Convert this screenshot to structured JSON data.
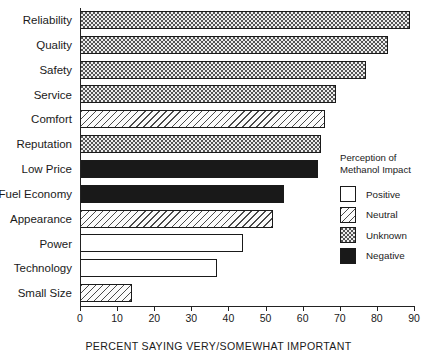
{
  "chart_data": {
    "type": "bar",
    "orientation": "horizontal",
    "title": "",
    "xlabel": "PERCENT SAYING VERY/SOMEWHAT IMPORTANT",
    "ylabel": "",
    "xlim": [
      0,
      90
    ],
    "xticks": [
      0,
      10,
      20,
      30,
      40,
      50,
      60,
      70,
      80,
      90
    ],
    "grid": false,
    "categories": [
      "Reliability",
      "Quality",
      "Safety",
      "Service",
      "Comfort",
      "Reputation",
      "Low Price",
      "Fuel Economy",
      "Appearance",
      "Power",
      "Technology",
      "Small Size"
    ],
    "values": [
      89,
      83,
      77,
      69,
      66,
      65,
      64,
      55,
      52,
      44,
      37,
      14
    ],
    "series": [
      {
        "name": "Percent saying very/somewhat important",
        "values": [
          89,
          83,
          77,
          69,
          66,
          65,
          64,
          55,
          52,
          44,
          37,
          14
        ]
      }
    ],
    "bars": [
      {
        "label": "Reliability",
        "value": 89,
        "pattern": "unknown"
      },
      {
        "label": "Quality",
        "value": 83,
        "pattern": "unknown"
      },
      {
        "label": "Safety",
        "value": 77,
        "pattern": "unknown"
      },
      {
        "label": "Service",
        "value": 69,
        "pattern": "unknown"
      },
      {
        "label": "Comfort",
        "value": 66,
        "pattern": "neutral"
      },
      {
        "label": "Reputation",
        "value": 65,
        "pattern": "unknown"
      },
      {
        "label": "Low Price",
        "value": 64,
        "pattern": "negative"
      },
      {
        "label": "Fuel Economy",
        "value": 55,
        "pattern": "negative"
      },
      {
        "label": "Appearance",
        "value": 52,
        "pattern": "neutral"
      },
      {
        "label": "Power",
        "value": 44,
        "pattern": "positive"
      },
      {
        "label": "Technology",
        "value": 37,
        "pattern": "positive"
      },
      {
        "label": "Small Size",
        "value": 14,
        "pattern": "neutral"
      }
    ],
    "legend": {
      "position": "right",
      "title_line1": "Perception of",
      "title_line2": "Methanol Impact",
      "entries": [
        {
          "label": "Positive",
          "pattern": "positive"
        },
        {
          "label": "Neutral",
          "pattern": "neutral"
        },
        {
          "label": "Unknown",
          "pattern": "unknown"
        },
        {
          "label": "Negative",
          "pattern": "negative"
        }
      ]
    },
    "colors": {
      "axis": "#222222",
      "bar_outline": "#1a1a1a",
      "positive_fill": "#ffffff",
      "neutral_fill": "#fbfbfb",
      "unknown_fill": "#ededed",
      "negative_fill": "#191919"
    }
  }
}
